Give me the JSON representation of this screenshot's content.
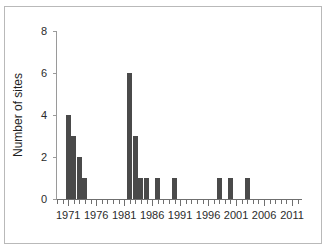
{
  "chart_data": {
    "type": "bar",
    "title": "",
    "xlabel": "",
    "ylabel": "Number of sites",
    "xlim": [
      1969,
      2012.6
    ],
    "ylim": [
      0,
      8
    ],
    "grid": false,
    "legend": null,
    "x_major_tick_labels": [
      "1971",
      "1976",
      "1981",
      "1986",
      "1991",
      "1996",
      "2001",
      "2006",
      "2011"
    ],
    "x_major_tick_values": [
      1971,
      1976,
      1981,
      1986,
      1991,
      1996,
      2001,
      2006,
      2011
    ],
    "x_minor_tick_step": 1,
    "y_tick_labels": [
      "0",
      "2",
      "4",
      "6",
      "8"
    ],
    "y_tick_values": [
      0,
      2,
      4,
      6,
      8
    ],
    "bar_color": "#4a4a4a",
    "categories": [
      1971,
      1972,
      1973,
      1974,
      1982,
      1983,
      1984,
      1985,
      1987,
      1990,
      1998,
      2000,
      2003
    ],
    "values": [
      4,
      3,
      2,
      1,
      6,
      3,
      1,
      1,
      1,
      1,
      1,
      1,
      1
    ],
    "bars": [
      {
        "year": 1971,
        "value": 4
      },
      {
        "year": 1972,
        "value": 3
      },
      {
        "year": 1973,
        "value": 2
      },
      {
        "year": 1974,
        "value": 1
      },
      {
        "year": 1982,
        "value": 6
      },
      {
        "year": 1983,
        "value": 3
      },
      {
        "year": 1984,
        "value": 1
      },
      {
        "year": 1985,
        "value": 1
      },
      {
        "year": 1987,
        "value": 1
      },
      {
        "year": 1990,
        "value": 1
      },
      {
        "year": 1998,
        "value": 1
      },
      {
        "year": 2000,
        "value": 1
      },
      {
        "year": 2003,
        "value": 1
      }
    ]
  }
}
